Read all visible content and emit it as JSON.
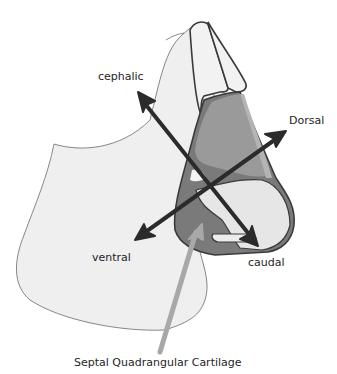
{
  "diagram": {
    "labels": {
      "cephalic": "cephalic",
      "dorsal": "Dorsal",
      "ventral": "ventral",
      "caudal": "caudal",
      "structure": "Septal Quadrangular Cartilage"
    },
    "arrows": [
      {
        "name": "cephalic-caudal-axis",
        "from": "caudal",
        "to": "cephalic",
        "bidirectional": true
      },
      {
        "name": "dorsal-ventral-axis",
        "from": "ventral",
        "to": "Dorsal",
        "bidirectional": true
      },
      {
        "name": "pointer-arrow",
        "target": "Septal Quadrangular Cartilage"
      }
    ],
    "colors": {
      "face_fill": "#efefef",
      "outline": "#3a3a3a",
      "cartilage_dark": "#6e6e6e",
      "cartilage_mid": "#8c8c8c",
      "cartilage_light": "#a6a6a6",
      "arrow": "#2b2b2b",
      "pointer": "#a8a8a8"
    }
  }
}
